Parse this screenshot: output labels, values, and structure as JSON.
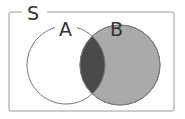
{
  "diagram": {
    "type": "venn",
    "universe_label": "S",
    "sets": [
      {
        "label": "A",
        "fill": "#ffffff"
      },
      {
        "label": "B",
        "fill": "#aaaaaa"
      }
    ],
    "intersection_fill": "#4a4a4a",
    "stroke": "#777777",
    "frame_stroke": "#999999"
  }
}
